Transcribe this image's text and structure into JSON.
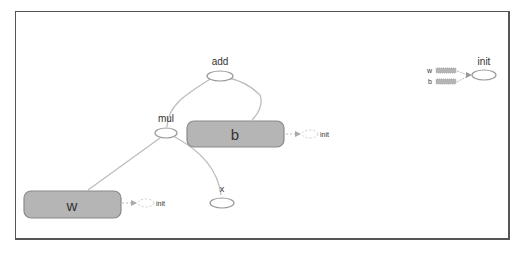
{
  "graph": {
    "nodes": {
      "add": {
        "label": "add"
      },
      "mul": {
        "label": "mul"
      },
      "x": {
        "label": "x"
      },
      "w": {
        "label": "w",
        "init_label": "init"
      },
      "b": {
        "label": "b",
        "init_label": "init"
      },
      "init": {
        "label": "init",
        "inputs": [
          "w",
          "b"
        ]
      }
    },
    "colors": {
      "variable_fill": "#b5b5b5",
      "variable_stroke": "#8a8a8a",
      "edge": "#bdbdbd",
      "op_stroke": "#999999",
      "frame": "#555555"
    }
  }
}
